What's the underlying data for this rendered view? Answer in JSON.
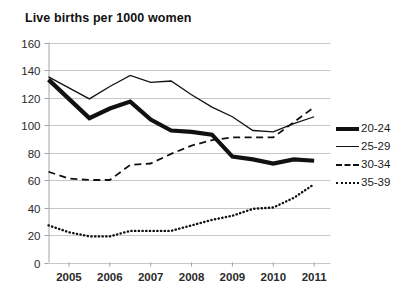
{
  "chart_data": {
    "type": "line",
    "title": "Live births per 1000 women",
    "xlabel": "",
    "ylabel": "",
    "xlim": [
      2004.5,
      2011.4
    ],
    "ylim": [
      0,
      160
    ],
    "ytick_step": 20,
    "yticks": [
      "160",
      "140",
      "120",
      "100",
      "80",
      "60",
      "40",
      "20",
      "0"
    ],
    "xticks": [
      "2005",
      "2006",
      "2007",
      "2008",
      "2009",
      "2010",
      "2011"
    ],
    "categories": [
      2004.5,
      2005.0,
      2005.5,
      2006.0,
      2006.5,
      2007.0,
      2007.5,
      2008.0,
      2008.5,
      2009.0,
      2009.5,
      2010.0,
      2010.5,
      2011.0
    ],
    "grid": true,
    "legend_position": "right",
    "line_color": "#111111",
    "grid_color": "#b9b9b9",
    "series": [
      {
        "name": "20-24",
        "style": "thick-solid",
        "values": [
          133,
          119,
          105,
          112,
          117,
          104,
          96,
          95,
          93,
          77,
          75,
          72,
          75,
          74
        ]
      },
      {
        "name": "25-29",
        "style": "thin-solid",
        "values": [
          135,
          127,
          119,
          128,
          136,
          131,
          132,
          122,
          113,
          106,
          96,
          95,
          101,
          106
        ]
      },
      {
        "name": "30-34",
        "style": "dashed",
        "values": [
          66,
          61,
          60,
          60,
          71,
          72,
          79,
          85,
          89,
          91,
          91,
          91,
          102,
          113
        ]
      },
      {
        "name": "35-39",
        "style": "dotted",
        "values": [
          27,
          22,
          19,
          19,
          23,
          23,
          23,
          27,
          31,
          34,
          39,
          40,
          47,
          57
        ]
      }
    ],
    "legend": [
      {
        "label": "20-24",
        "style": "thick-solid"
      },
      {
        "label": "25-29",
        "style": "thin-solid"
      },
      {
        "label": "30-34",
        "style": "dashed"
      },
      {
        "label": "35-39",
        "style": "dotted"
      }
    ]
  }
}
